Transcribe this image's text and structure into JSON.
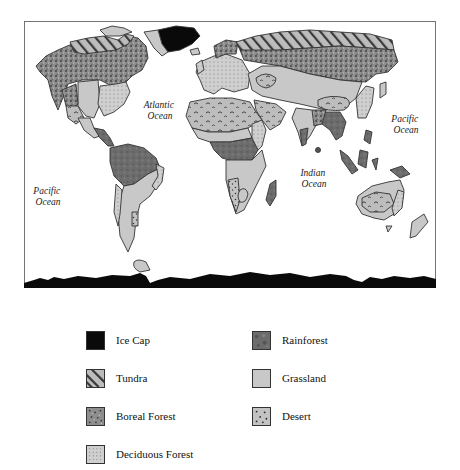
{
  "map": {
    "oceans": [
      {
        "id": "atlantic",
        "lines": [
          "Atlantic",
          "Ocean"
        ]
      },
      {
        "id": "pacific-west",
        "lines": [
          "Pacific",
          "Ocean"
        ]
      },
      {
        "id": "pacific-east",
        "lines": [
          "Pacific",
          "Ocean"
        ]
      },
      {
        "id": "indian",
        "lines": [
          "Indian",
          "Ocean"
        ]
      }
    ]
  },
  "legend": {
    "items": [
      {
        "key": "ice-cap",
        "label": "Ice Cap",
        "pattern": "solid-black"
      },
      {
        "key": "rainforest",
        "label": "Rainforest",
        "pattern": "dark-mottled"
      },
      {
        "key": "tundra",
        "label": "Tundra",
        "pattern": "diagonal-stripes"
      },
      {
        "key": "grassland",
        "label": "Grassland",
        "pattern": "light-gray"
      },
      {
        "key": "boreal-forest",
        "label": "Boreal Forest",
        "pattern": "dark-speckle"
      },
      {
        "key": "desert",
        "label": "Desert",
        "pattern": "sparse-dots"
      },
      {
        "key": "deciduous-forest",
        "label": "Deciduous Forest",
        "pattern": "fine-dot-grid"
      }
    ]
  },
  "colors": {
    "ice": "#0a0a0a",
    "rainforest": "#6e6e6e",
    "grassland": "#c8c8c8",
    "tundra_bg": "#bcbcbc",
    "boreal": "#8e8e8e",
    "desert_bg": "#bdbdbd",
    "deciduous_bg": "#cfcfcf",
    "outline": "#333333"
  }
}
